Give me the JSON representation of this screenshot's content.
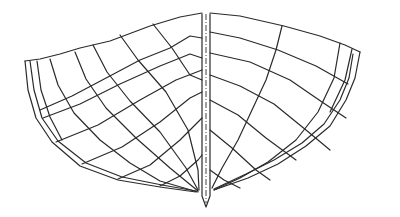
{
  "diagram": {
    "type": "boat-hull-body-plan",
    "stroke_color": "#2a2a2a",
    "background": "#ffffff",
    "keel": {
      "left": [
        [
          202,
          14
        ],
        [
          202,
          196
        ],
        [
          206,
          207
        ],
        [
          210,
          196
        ],
        [
          210,
          14
        ]
      ],
      "centerline": [
        [
          206,
          14
        ],
        [
          206,
          203
        ]
      ]
    },
    "left_half": {
      "outline": [
        [
          [
            25,
            61
          ],
          [
            40,
            59
          ],
          [
            60,
            54
          ],
          [
            80,
            48
          ],
          [
            110,
            41
          ],
          [
            150,
            26
          ],
          [
            180,
            17
          ],
          [
            202,
            13
          ]
        ],
        [
          [
            25,
            61
          ],
          [
            28,
            90
          ],
          [
            36,
            118
          ],
          [
            52,
            142
          ],
          [
            80,
            166
          ],
          [
            118,
            180
          ],
          [
            160,
            187
          ],
          [
            196,
            192
          ]
        ],
        [
          [
            30,
            61
          ],
          [
            34,
            90
          ],
          [
            42,
            118
          ],
          [
            58,
            141
          ],
          [
            86,
            163
          ],
          [
            122,
            177
          ],
          [
            162,
            185
          ],
          [
            196,
            191
          ]
        ]
      ],
      "stations": [
        [
          [
            37,
            61
          ],
          [
            41,
            90
          ],
          [
            50,
            117
          ],
          [
            62,
            140
          ]
        ],
        [
          [
            50,
            59
          ],
          [
            58,
            85
          ],
          [
            74,
            113
          ],
          [
            100,
            140
          ],
          [
            130,
            163
          ],
          [
            160,
            181
          ],
          [
            198,
            192
          ]
        ],
        [
          [
            75,
            52
          ],
          [
            86,
            79
          ],
          [
            106,
            108
          ],
          [
            136,
            138
          ],
          [
            170,
            168
          ],
          [
            198,
            191
          ]
        ],
        [
          [
            93,
            45
          ],
          [
            107,
            72
          ],
          [
            130,
            101
          ],
          [
            160,
            132
          ],
          [
            186,
            168
          ],
          [
            198,
            190
          ]
        ],
        [
          [
            120,
            35
          ],
          [
            138,
            60
          ],
          [
            166,
            92
          ],
          [
            188,
            130
          ],
          [
            198,
            170
          ],
          [
            199,
            190
          ]
        ],
        [
          [
            153,
            24
          ],
          [
            172,
            48
          ],
          [
            190,
            75
          ],
          [
            202,
            80
          ]
        ]
      ],
      "waterlines": [
        [
          [
            40,
            110
          ],
          [
            72,
            96
          ],
          [
            108,
            77
          ],
          [
            140,
            60
          ],
          [
            170,
            48
          ],
          [
            190,
            36
          ],
          [
            202,
            38
          ]
        ],
        [
          [
            43,
            118
          ],
          [
            80,
            104
          ],
          [
            120,
            84
          ],
          [
            160,
            66
          ],
          [
            190,
            54
          ],
          [
            202,
            58
          ]
        ],
        [
          [
            56,
            142
          ],
          [
            98,
            125
          ],
          [
            140,
            100
          ],
          [
            176,
            80
          ],
          [
            202,
            70
          ]
        ],
        [
          [
            82,
            164
          ],
          [
            122,
            147
          ],
          [
            160,
            122
          ],
          [
            190,
            98
          ],
          [
            202,
            92
          ]
        ],
        [
          [
            118,
            179
          ],
          [
            150,
            165
          ],
          [
            180,
            140
          ],
          [
            202,
            118
          ]
        ],
        [
          [
            160,
            186
          ],
          [
            180,
            176
          ],
          [
            198,
            160
          ],
          [
            202,
            155
          ]
        ]
      ]
    },
    "right_half": {
      "outline": [
        [
          [
            210,
            13
          ],
          [
            240,
            16
          ],
          [
            284,
            26
          ],
          [
            320,
            36
          ],
          [
            345,
            45
          ],
          [
            360,
            52
          ]
        ],
        [
          [
            360,
            52
          ],
          [
            355,
            78
          ],
          [
            346,
            100
          ],
          [
            330,
            126
          ],
          [
            306,
            146
          ],
          [
            278,
            164
          ],
          [
            248,
            178
          ],
          [
            214,
            190
          ]
        ],
        [
          [
            353,
            54
          ],
          [
            349,
            78
          ],
          [
            340,
            100
          ],
          [
            324,
            124
          ],
          [
            302,
            143
          ],
          [
            274,
            160
          ],
          [
            246,
            174
          ],
          [
            214,
            189
          ]
        ]
      ],
      "stations": [
        [
          [
            282,
            26
          ],
          [
            276,
            50
          ],
          [
            266,
            80
          ],
          [
            252,
            110
          ],
          [
            238,
            140
          ],
          [
            222,
            168
          ],
          [
            212,
            188
          ]
        ],
        [
          [
            340,
            43
          ],
          [
            334,
            78
          ],
          [
            318,
            112
          ],
          [
            296,
            140
          ],
          [
            268,
            162
          ],
          [
            240,
            178
          ],
          [
            214,
            190
          ]
        ],
        [
          [
            352,
            49
          ],
          [
            345,
            80
          ],
          [
            330,
            112
          ]
        ]
      ],
      "waterlines": [
        [
          [
            210,
            32
          ],
          [
            240,
            38
          ],
          [
            278,
            50
          ],
          [
            316,
            66
          ],
          [
            348,
            84
          ]
        ],
        [
          [
            210,
            53
          ],
          [
            250,
            62
          ],
          [
            290,
            80
          ],
          [
            322,
            102
          ],
          [
            346,
            118
          ]
        ],
        [
          [
            210,
            75
          ],
          [
            240,
            86
          ],
          [
            274,
            104
          ],
          [
            306,
            130
          ],
          [
            330,
            150
          ]
        ],
        [
          [
            210,
            100
          ],
          [
            238,
            115
          ],
          [
            266,
            138
          ],
          [
            296,
            160
          ]
        ],
        [
          [
            210,
            130
          ],
          [
            232,
            148
          ],
          [
            256,
            170
          ],
          [
            270,
            180
          ]
        ],
        [
          [
            210,
            170
          ],
          [
            224,
            180
          ],
          [
            240,
            188
          ]
        ]
      ]
    }
  }
}
